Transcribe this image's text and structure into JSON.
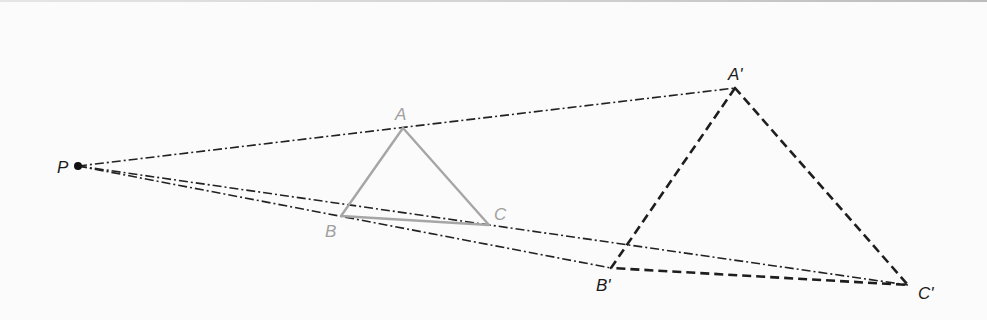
{
  "diagram": {
    "type": "dilation",
    "center": {
      "label": "P",
      "x": 78,
      "y": 166
    },
    "original": {
      "vertices": [
        {
          "label": "A",
          "x": 403,
          "y": 128
        },
        {
          "label": "B",
          "x": 341,
          "y": 216
        },
        {
          "label": "C",
          "x": 489,
          "y": 225
        }
      ],
      "color": "#a6a6a6"
    },
    "image": {
      "vertices": [
        {
          "label": "A'",
          "x": 735,
          "y": 88
        },
        {
          "label": "B'",
          "x": 611,
          "y": 268
        },
        {
          "label": "C'",
          "x": 908,
          "y": 285
        }
      ],
      "color": "#1e1e1e"
    },
    "labels": {
      "P": "P",
      "A": "A",
      "B": "B",
      "C": "C",
      "A1": "A'",
      "B1": "B'",
      "C1": "C'"
    }
  }
}
